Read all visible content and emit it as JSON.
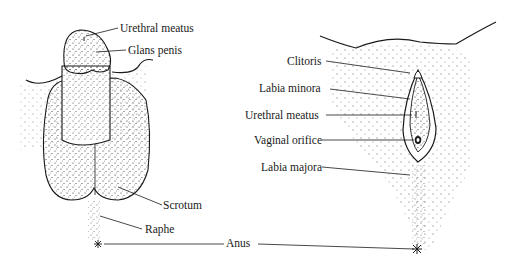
{
  "diagram": {
    "type": "anatomical-illustration",
    "panels": [
      {
        "name": "male-external-genitalia",
        "labels": [
          "Urethral meatus",
          "Glans penis",
          "Scrotum",
          "Raphe"
        ]
      },
      {
        "name": "female-external-genitalia",
        "labels": [
          "Clitoris",
          "Labia minora",
          "Urethral meatus",
          "Vaginal orifice",
          "Labia majora"
        ]
      }
    ],
    "shared_label": "Anus"
  },
  "labels": {
    "male_urethral_meatus": "Urethral meatus",
    "glans_penis": "Glans penis",
    "scrotum": "Scrotum",
    "raphe": "Raphe",
    "anus": "Anus",
    "clitoris": "Clitoris",
    "labia_minora": "Labia minora",
    "female_urethral_meatus": "Urethral meatus",
    "vaginal_orifice": "Vaginal orifice",
    "labia_majora": "Labia majora"
  },
  "colors": {
    "ink": "#1a1a1a",
    "background": "#ffffff"
  }
}
